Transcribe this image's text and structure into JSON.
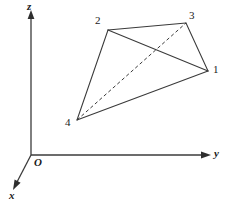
{
  "figure": {
    "type": "3d-coordinate-diagram",
    "background_color": "#ffffff",
    "line_color": "#3a3a3a",
    "width": 241,
    "height": 211,
    "axes": {
      "origin_label": "O",
      "origin_point": [
        31,
        155
      ],
      "items": [
        {
          "name": "z",
          "label": "z",
          "from": [
            31,
            155
          ],
          "to": [
            31,
            15
          ],
          "label_pos": [
            28,
            2
          ]
        },
        {
          "name": "y",
          "label": "y",
          "from": [
            31,
            155
          ],
          "to": [
            209,
            155
          ],
          "label_pos": [
            214,
            148
          ]
        },
        {
          "name": "x",
          "label": "x",
          "from": [
            31,
            155
          ],
          "to": [
            14,
            188
          ],
          "label_pos": [
            9,
            191
          ]
        }
      ]
    },
    "vertices": [
      {
        "id": "1",
        "label": "1",
        "point": [
          208,
          71
        ],
        "label_pos": [
          213,
          64
        ]
      },
      {
        "id": "2",
        "label": "2",
        "point": [
          108,
          30
        ],
        "label_pos": [
          95,
          16
        ]
      },
      {
        "id": "3",
        "label": "3",
        "point": [
          186,
          23
        ],
        "label_pos": [
          189,
          11
        ]
      },
      {
        "id": "4",
        "label": "4",
        "point": [
          77,
          120
        ],
        "label_pos": [
          65,
          118
        ]
      }
    ],
    "edges": [
      {
        "name": "edge-2-3",
        "from": "2",
        "to": "3",
        "style": "solid"
      },
      {
        "name": "edge-3-1",
        "from": "3",
        "to": "1",
        "style": "solid"
      },
      {
        "name": "edge-1-4",
        "from": "1",
        "to": "4",
        "style": "solid"
      },
      {
        "name": "edge-4-2",
        "from": "4",
        "to": "2",
        "style": "solid"
      },
      {
        "name": "edge-2-1",
        "from": "2",
        "to": "1",
        "style": "solid"
      },
      {
        "name": "edge-4-3",
        "from": "4",
        "to": "3",
        "style": "dashed"
      }
    ]
  }
}
